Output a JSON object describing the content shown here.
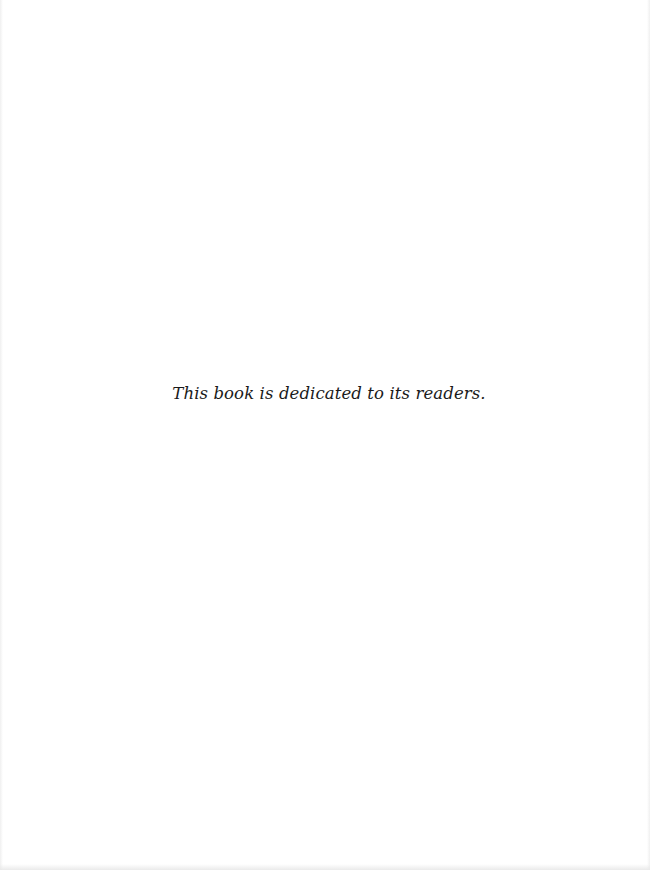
{
  "page": {
    "type": "dedication",
    "dedication_text": "This book is dedicated to its readers."
  }
}
